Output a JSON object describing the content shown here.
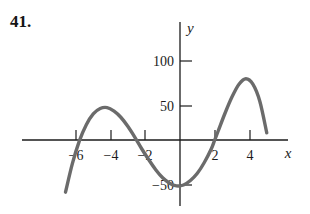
{
  "problem": {
    "number": "41."
  },
  "chart_data": {
    "type": "line",
    "title": "",
    "subtitle": "",
    "xlabel": "x",
    "ylabel": "y",
    "xlim": [
      -7.6,
      7.0
    ],
    "ylim": [
      -85,
      125
    ],
    "grid": false,
    "legend": null,
    "axis_colors": {
      "axis": "#1b1b1b",
      "curve": "#6b6b6b",
      "background": "#ffffff"
    },
    "xticks": [
      -6,
      -4,
      -2,
      2,
      4
    ],
    "xtick_labels": [
      "−6",
      "−4",
      "−2",
      "2",
      "4"
    ],
    "yticks": [
      100,
      50,
      -50
    ],
    "ytick_labels": [
      "100",
      "50",
      "−50"
    ],
    "series": [
      {
        "name": "cubic curve",
        "comment": "approximately y = 3(x+5)(x)(x-3.7)",
        "x": [
          -7.4,
          -7.0,
          -6.6,
          -6.2,
          -5.8,
          -5.4,
          -5.0,
          -4.6,
          -4.2,
          -3.8,
          -3.4,
          -3.0,
          -2.6,
          -2.2,
          -1.8,
          -1.4,
          -1.0,
          -0.6,
          -0.2,
          0.2,
          0.6,
          1.0,
          1.4,
          1.8,
          2.0,
          2.2,
          2.6,
          3.0,
          3.4,
          3.8,
          4.2,
          4.6,
          5.0
        ],
        "y": [
          -140,
          -96,
          -58,
          -26,
          -1,
          17,
          29,
          35,
          36,
          32,
          25,
          15,
          3,
          -10,
          -22,
          -33,
          -42,
          -48,
          -51,
          -50,
          -45,
          -37,
          -25,
          -10,
          0,
          10,
          30,
          48,
          62,
          68,
          62,
          43,
          8
        ]
      }
    ],
    "features": {
      "x_intercepts": [
        -4.7,
        0,
        3.6
      ],
      "local_minimum": {
        "x": -3,
        "y": -58
      },
      "local_maximum": {
        "x": 2,
        "y": 52
      }
    }
  },
  "icons": {
    "curve": "cubic-curve-icon"
  }
}
